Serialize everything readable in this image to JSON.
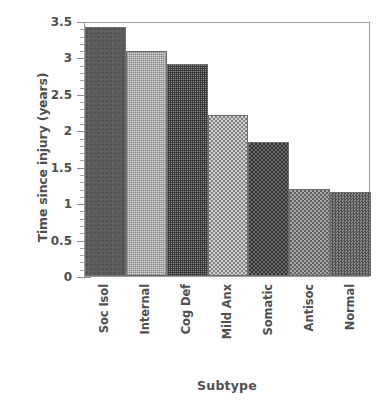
{
  "chart_data": {
    "type": "bar",
    "title": "",
    "xlabel": "Subtype",
    "ylabel": "Time since injury (years)",
    "categories": [
      "Soc Isol",
      "Internal",
      "Cog Def",
      "Mild Anx",
      "Somatic",
      "Antisoc",
      "Normal"
    ],
    "values": [
      3.43,
      3.1,
      2.92,
      2.22,
      1.85,
      1.2,
      1.16
    ],
    "ylim": [
      0,
      3.5
    ],
    "ytick_labels": [
      "0",
      "0.5",
      "1",
      "1.5",
      "2",
      "2.5",
      "3",
      "3.5"
    ],
    "ytick_values": [
      0,
      0.5,
      1,
      1.5,
      2,
      2.5,
      3,
      3.5
    ],
    "minor_tick_step": 0.1,
    "grid": false,
    "legend": "none",
    "bar_fills": [
      "solid-dark-gray",
      "light-fine-grid",
      "dark-fine-grid",
      "light-checker",
      "dark-checker",
      "mid-checker",
      "mid-dot-checker"
    ],
    "colors": {
      "bar_outline": "#6f6f6f",
      "axis": "#9a9a9a",
      "text": "#4f4f4f",
      "background": "#ffffff"
    }
  }
}
